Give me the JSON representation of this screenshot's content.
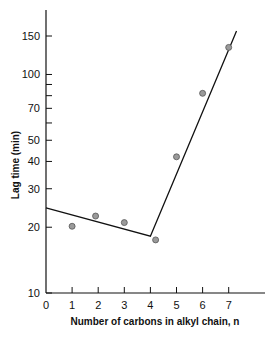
{
  "chart_data": {
    "type": "scatter",
    "title": "",
    "xlabel": "Number of carbons in alkyl chain, n",
    "ylabel": "Lag time (min)",
    "yscale": "log",
    "xlim": [
      0,
      8
    ],
    "ylim": [
      10,
      180
    ],
    "x_ticks": [
      0,
      1,
      2,
      3,
      4,
      5,
      6,
      7
    ],
    "y_ticks": [
      10,
      20,
      30,
      40,
      50,
      70,
      100,
      150
    ],
    "y_minor_ticks": [
      60,
      80,
      90
    ],
    "grid": false,
    "legend": null,
    "series": [
      {
        "name": "measured",
        "type": "scatter",
        "x": [
          1,
          1.9,
          3,
          4.2,
          5,
          6,
          7
        ],
        "y": [
          20.2,
          22.5,
          21,
          17.5,
          42,
          82,
          133
        ]
      },
      {
        "name": "fit",
        "type": "line",
        "x": [
          0,
          4,
          7.3
        ],
        "y": [
          24.5,
          18.2,
          158
        ]
      }
    ]
  }
}
